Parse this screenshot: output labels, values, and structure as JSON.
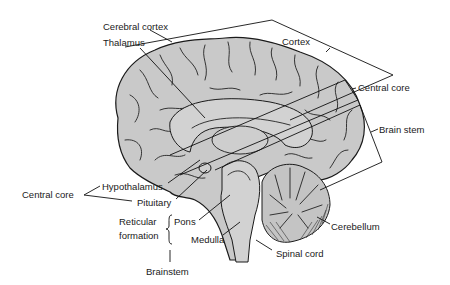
{
  "diagram": {
    "colors": {
      "brain_fill": "#c9c9c9",
      "line": "#111111",
      "text": "#1a1a1a",
      "background": "#ffffff"
    },
    "labels": {
      "cerebral_cortex": "Cerebral cortex",
      "thalamus": "Thalamus",
      "cortex": "Cortex",
      "central_core_right": "Central core",
      "brain_stem": "Brain stem",
      "central_core_left": "Central core",
      "hypothalamus": "Hypothalamus",
      "pituitary": "Pituitary",
      "reticular": "Reticular",
      "formation": "formation",
      "pons": "Pons",
      "medulla": "Medulla",
      "brainstem": "Brainstem",
      "cerebellum": "Cerebellum",
      "spinal_cord": "Spinal cord"
    },
    "groups": [
      {
        "name": "Cortex",
        "members": [
          "Cerebral cortex"
        ]
      },
      {
        "name": "Central core",
        "members": [
          "Thalamus",
          "Hypothalamus",
          "Pituitary"
        ]
      },
      {
        "name": "Brain stem",
        "members": [
          "Pons",
          "Medulla"
        ]
      },
      {
        "name": "Reticular formation",
        "members": [
          "Pons",
          "Medulla"
        ]
      }
    ]
  }
}
